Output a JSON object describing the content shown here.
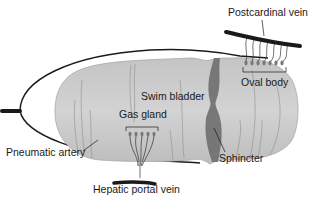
{
  "diagram": {
    "labels": {
      "postcardinal_vein": "Postcardinal vein",
      "swim_bladder": "Swim bladder",
      "oval_body": "Oval body",
      "gas_gland": "Gas gland",
      "pneumatic_artery": "Pneumatic artery",
      "sphincter": "Sphincter",
      "hepatic_portal_vein": "Hepatic portal vein"
    },
    "colors": {
      "bladder_fill": "#b9b9b9",
      "bladder_light": "#d6d6d6",
      "sphincter": "#6e6e6e",
      "vessel": "#1a1a1a",
      "text": "#1a1a1a"
    }
  }
}
